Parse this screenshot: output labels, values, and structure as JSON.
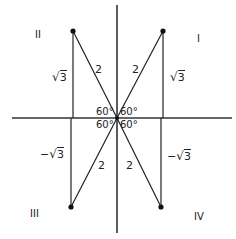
{
  "diagram": {
    "type": "reference-triangles-unit-circle-60deg",
    "quadrant_labels": {
      "I": "I",
      "II": "II",
      "III": "III",
      "IV": "IV"
    },
    "hypotenuse_label": "2",
    "angle_label": "60°",
    "opposite_labels": {
      "positive_prefix": "",
      "negative_prefix": "−",
      "radicand": "3"
    },
    "points": [
      {
        "quadrant": "I",
        "x": 163,
        "y": 31
      },
      {
        "quadrant": "II",
        "x": 73,
        "y": 31
      },
      {
        "quadrant": "III",
        "x": 71,
        "y": 207
      },
      {
        "quadrant": "IV",
        "x": 161,
        "y": 207
      }
    ],
    "origin": {
      "x": 117,
      "y": 118
    },
    "colors": {
      "line": "#222222",
      "axis": "#333333",
      "text": "#222222"
    }
  }
}
